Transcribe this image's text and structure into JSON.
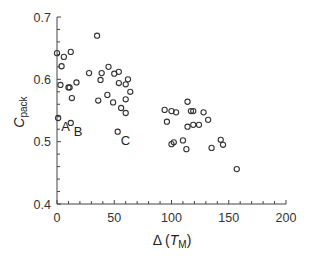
{
  "chart_data": {
    "type": "scatter",
    "title": "",
    "xlabel": "Δ (T_M)",
    "xlabel_parts": {
      "prefix": "Δ (",
      "var": "T",
      "sub": "M",
      "suffix": ")"
    },
    "ylabel": "C_pack",
    "ylabel_parts": {
      "var": "C",
      "sub": "pack"
    },
    "xlim": [
      0,
      200
    ],
    "ylim": [
      0.4,
      0.7
    ],
    "xticks": [
      0,
      50,
      100,
      150,
      200
    ],
    "xtick_labels": [
      "0",
      "50",
      "100",
      "150",
      "200"
    ],
    "yticks": [
      0.4,
      0.5,
      0.6,
      0.7
    ],
    "ytick_labels": [
      "0.4",
      "0.5",
      "0.6",
      "0.7"
    ],
    "x_minor_step": 10,
    "y_minor_step": 0.02,
    "grid": false,
    "legend": null,
    "marker": "open-circle",
    "marker_color": "#333333",
    "points": [
      {
        "x": 0,
        "y": 0.642
      },
      {
        "x": 12,
        "y": 0.644
      },
      {
        "x": 6,
        "y": 0.636
      },
      {
        "x": 4,
        "y": 0.621
      },
      {
        "x": 3,
        "y": 0.591
      },
      {
        "x": 10,
        "y": 0.587
      },
      {
        "x": 11,
        "y": 0.587
      },
      {
        "x": 17,
        "y": 0.595
      },
      {
        "x": 13,
        "y": 0.57
      },
      {
        "x": 1,
        "y": 0.538,
        "label": "A"
      },
      {
        "x": 12,
        "y": 0.53,
        "label": "B"
      },
      {
        "x": 53,
        "y": 0.516,
        "label": "C"
      },
      {
        "x": 35,
        "y": 0.67
      },
      {
        "x": 28,
        "y": 0.61
      },
      {
        "x": 39,
        "y": 0.61
      },
      {
        "x": 45,
        "y": 0.62
      },
      {
        "x": 50,
        "y": 0.609
      },
      {
        "x": 54,
        "y": 0.612
      },
      {
        "x": 38,
        "y": 0.599
      },
      {
        "x": 62,
        "y": 0.6
      },
      {
        "x": 54,
        "y": 0.594
      },
      {
        "x": 60,
        "y": 0.592
      },
      {
        "x": 64,
        "y": 0.58
      },
      {
        "x": 44,
        "y": 0.575
      },
      {
        "x": 36,
        "y": 0.566
      },
      {
        "x": 49,
        "y": 0.563
      },
      {
        "x": 60,
        "y": 0.568
      },
      {
        "x": 56,
        "y": 0.554
      },
      {
        "x": 60,
        "y": 0.546
      },
      {
        "x": 94,
        "y": 0.551
      },
      {
        "x": 100,
        "y": 0.549
      },
      {
        "x": 104,
        "y": 0.547
      },
      {
        "x": 96,
        "y": 0.532
      },
      {
        "x": 114,
        "y": 0.564
      },
      {
        "x": 117,
        "y": 0.549
      },
      {
        "x": 119,
        "y": 0.549
      },
      {
        "x": 128,
        "y": 0.547
      },
      {
        "x": 132,
        "y": 0.535
      },
      {
        "x": 114,
        "y": 0.524
      },
      {
        "x": 119,
        "y": 0.527
      },
      {
        "x": 124,
        "y": 0.527
      },
      {
        "x": 100,
        "y": 0.496
      },
      {
        "x": 102,
        "y": 0.499
      },
      {
        "x": 110,
        "y": 0.502
      },
      {
        "x": 113,
        "y": 0.488
      },
      {
        "x": 135,
        "y": 0.49
      },
      {
        "x": 143,
        "y": 0.503
      },
      {
        "x": 145,
        "y": 0.495
      },
      {
        "x": 157,
        "y": 0.456
      }
    ],
    "annotations": [
      {
        "text": "A",
        "x": 1,
        "y": 0.538
      },
      {
        "text": "B",
        "x": 12,
        "y": 0.53
      },
      {
        "text": "C",
        "x": 53,
        "y": 0.516
      }
    ]
  }
}
